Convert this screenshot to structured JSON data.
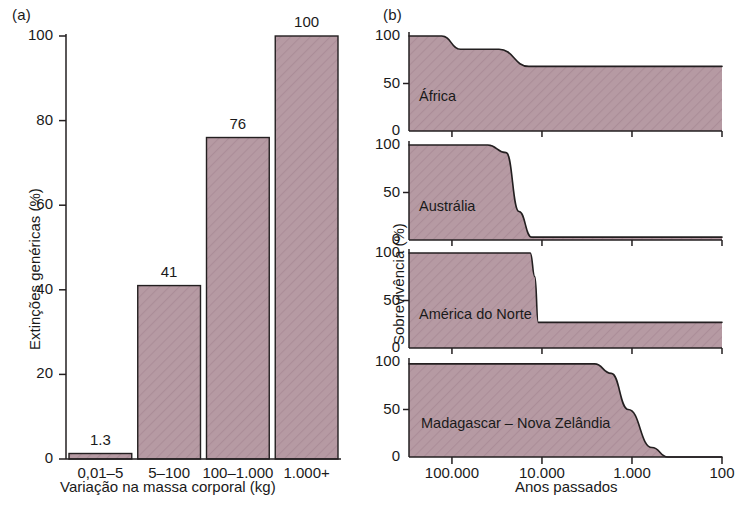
{
  "figure": {
    "panel_a_tag": "(a)",
    "panel_b_tag": "(b)"
  },
  "colors": {
    "bar_fill": "#b69aa3",
    "area_fill": "#bda3ab",
    "line": "#231f20",
    "text": "#1a1a1a",
    "background": "#ffffff"
  },
  "chart_data": [
    {
      "type": "bar",
      "panel": "(a)",
      "title": "",
      "xlabel": "Variação na massa corporal (kg)",
      "ylabel": "Extinções genéricas (%)",
      "categories": [
        "0,01–5",
        "5–100",
        "100–1.000",
        "1.000+"
      ],
      "values": [
        1.3,
        41,
        76,
        100
      ],
      "value_labels": [
        "1.3",
        "41",
        "76",
        "100"
      ],
      "ylim": [
        0,
        100
      ],
      "yticks": [
        0,
        20,
        40,
        60,
        80,
        100
      ],
      "ytick_labels": [
        "0",
        "20",
        "40",
        "60",
        "80",
        "100"
      ],
      "grid": false,
      "legend": "none"
    },
    {
      "type": "area",
      "panel": "(b)",
      "title": "",
      "xlabel": "Anos passados",
      "ylabel": "Sobrevivência (%)",
      "x_scale": "log-reversed",
      "xlim": [
        300000,
        100
      ],
      "xticks": [
        100000,
        10000,
        1000,
        100
      ],
      "xtick_labels": [
        "100.000",
        "10.000",
        "1.000",
        "100"
      ],
      "ylim": [
        0,
        100
      ],
      "yticks": [
        0,
        50,
        100
      ],
      "ytick_labels": [
        "0",
        "50",
        "100"
      ],
      "grid": false,
      "legend": "inline-annotations",
      "series": [
        {
          "name": "África",
          "x": [
            300000,
            130000,
            80000,
            30000,
            14000,
            100
          ],
          "values": [
            100,
            100,
            86,
            86,
            68,
            68
          ]
        },
        {
          "name": "Austrália",
          "x": [
            300000,
            40000,
            25000,
            18000,
            13000,
            100
          ],
          "values": [
            100,
            100,
            92,
            30,
            3,
            3
          ]
        },
        {
          "name": "América do Norte",
          "x": [
            300000,
            13500,
            12000,
            11000,
            100
          ],
          "values": [
            100,
            100,
            75,
            27,
            27
          ]
        },
        {
          "name": "Madagascar – Nova Zelândia",
          "x": [
            300000,
            2600,
            1700,
            1100,
            600,
            400,
            100
          ],
          "values": [
            98,
            98,
            88,
            50,
            10,
            0,
            0
          ]
        }
      ]
    }
  ]
}
